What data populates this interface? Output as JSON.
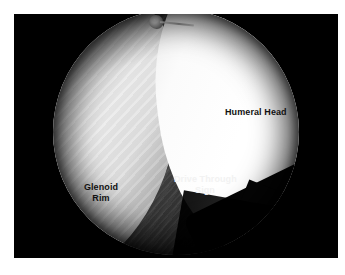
{
  "figure": {
    "kind": "arthroscopic-photograph",
    "page_background": "#ffffff",
    "panel_background": "#000000"
  },
  "scope_view": {
    "shape": "circular-fisheye",
    "vignette_color": "#000000",
    "background": "#0b0b0b"
  },
  "anatomy": {
    "glenoid_rim": {
      "label": "Glenoid Rim",
      "label_line_1": "Glenoid",
      "label_line_2": "Rim",
      "label_color": "#111111",
      "tone": "#e9e9e9",
      "position": "left"
    },
    "humeral_head": {
      "label": "Humeral Head",
      "label_line_1": "Humeral Head",
      "label_color": "#111111",
      "tone": "#ffffff",
      "position": "right"
    },
    "drive_through_sign": {
      "label": "Drive Through Sign",
      "label_line_1": "Drive Through",
      "label_line_2": "Sign",
      "label_color": "#f2f2f2",
      "tone": "#4a4a4a",
      "position": "center"
    }
  },
  "instrument": {
    "name": "probe-tip",
    "description": "metallic probe tip",
    "tip_color": "#ffffff",
    "shaft_color": "#9b9b9b"
  }
}
